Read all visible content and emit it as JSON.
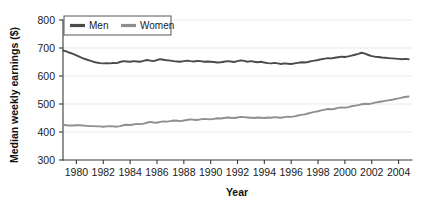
{
  "chart_data": {
    "type": "line",
    "title": "",
    "xlabel": "Year",
    "ylabel": "Median weekly earnings ($)",
    "xlim": [
      1979,
      2005
    ],
    "ylim": [
      300,
      800
    ],
    "yticks": [
      300,
      400,
      500,
      600,
      700,
      800
    ],
    "xticks": [
      1980,
      1982,
      1984,
      1986,
      1988,
      1990,
      1992,
      1994,
      1996,
      1998,
      2000,
      2002,
      2004
    ],
    "grid": true,
    "legend_position": "top-left",
    "colors": {
      "men": "#4a4a4a",
      "women": "#8f8f8f",
      "axis": "#3a3a3a",
      "grid": "#e9e9e9"
    },
    "series": [
      {
        "name": "Men",
        "color": "#4a4a4a",
        "x": [
          1979.0,
          1979.25,
          1979.5,
          1979.75,
          1980.0,
          1980.25,
          1980.5,
          1980.75,
          1981.0,
          1981.25,
          1981.5,
          1981.75,
          1982.0,
          1982.25,
          1982.5,
          1982.75,
          1983.0,
          1983.25,
          1983.5,
          1983.75,
          1984.0,
          1984.25,
          1984.5,
          1984.75,
          1985.0,
          1985.25,
          1985.5,
          1985.75,
          1986.0,
          1986.25,
          1986.5,
          1986.75,
          1987.0,
          1987.25,
          1987.5,
          1987.75,
          1988.0,
          1988.25,
          1988.5,
          1988.75,
          1989.0,
          1989.25,
          1989.5,
          1989.75,
          1990.0,
          1990.25,
          1990.5,
          1990.75,
          1991.0,
          1991.25,
          1991.5,
          1991.75,
          1992.0,
          1992.25,
          1992.5,
          1992.75,
          1993.0,
          1993.25,
          1993.5,
          1993.75,
          1994.0,
          1994.25,
          1994.5,
          1994.75,
          1995.0,
          1995.25,
          1995.5,
          1995.75,
          1996.0,
          1996.25,
          1996.5,
          1996.75,
          1997.0,
          1997.25,
          1997.5,
          1997.75,
          1998.0,
          1998.25,
          1998.5,
          1998.75,
          1999.0,
          1999.25,
          1999.5,
          1999.75,
          2000.0,
          2000.25,
          2000.5,
          2000.75,
          2001.0,
          2001.25,
          2001.5,
          2001.75,
          2002.0,
          2002.25,
          2002.5,
          2002.75,
          2003.0,
          2003.25,
          2003.5,
          2003.75,
          2004.0,
          2004.25,
          2004.5,
          2004.75
        ],
        "values": [
          691,
          688,
          683,
          679,
          674,
          668,
          663,
          659,
          655,
          651,
          648,
          646,
          645,
          646,
          645,
          647,
          646,
          650,
          653,
          652,
          651,
          653,
          652,
          651,
          654,
          657,
          655,
          653,
          657,
          660,
          658,
          656,
          655,
          653,
          652,
          651,
          653,
          655,
          653,
          652,
          654,
          653,
          651,
          652,
          651,
          650,
          648,
          649,
          651,
          653,
          652,
          650,
          653,
          656,
          654,
          651,
          653,
          651,
          649,
          651,
          648,
          646,
          645,
          647,
          645,
          643,
          645,
          644,
          643,
          645,
          647,
          649,
          648,
          650,
          653,
          655,
          657,
          660,
          662,
          664,
          663,
          665,
          667,
          669,
          668,
          670,
          673,
          676,
          679,
          683,
          680,
          675,
          671,
          669,
          668,
          666,
          665,
          664,
          663,
          662,
          661,
          660,
          661,
          660
        ]
      },
      {
        "name": "Women",
        "color": "#8f8f8f",
        "x": [
          1979.0,
          1979.25,
          1979.5,
          1979.75,
          1980.0,
          1980.25,
          1980.5,
          1980.75,
          1981.0,
          1981.25,
          1981.5,
          1981.75,
          1982.0,
          1982.25,
          1982.5,
          1982.75,
          1983.0,
          1983.25,
          1983.5,
          1983.75,
          1984.0,
          1984.25,
          1984.5,
          1984.75,
          1985.0,
          1985.25,
          1985.5,
          1985.75,
          1986.0,
          1986.25,
          1986.5,
          1986.75,
          1987.0,
          1987.25,
          1987.5,
          1987.75,
          1988.0,
          1988.25,
          1988.5,
          1988.75,
          1989.0,
          1989.25,
          1989.5,
          1989.75,
          1990.0,
          1990.25,
          1990.5,
          1990.75,
          1991.0,
          1991.25,
          1991.5,
          1991.75,
          1992.0,
          1992.25,
          1992.5,
          1992.75,
          1993.0,
          1993.25,
          1993.5,
          1993.75,
          1994.0,
          1994.25,
          1994.5,
          1994.75,
          1995.0,
          1995.25,
          1995.5,
          1995.75,
          1996.0,
          1996.25,
          1996.5,
          1996.75,
          1997.0,
          1997.25,
          1997.5,
          1997.75,
          1998.0,
          1998.25,
          1998.5,
          1998.75,
          1999.0,
          1999.25,
          1999.5,
          1999.75,
          2000.0,
          2000.25,
          2000.5,
          2000.75,
          2001.0,
          2001.25,
          2001.5,
          2001.75,
          2002.0,
          2002.25,
          2002.5,
          2002.75,
          2003.0,
          2003.25,
          2003.5,
          2003.75,
          2004.0,
          2004.25,
          2004.5,
          2004.75
        ],
        "values": [
          426,
          424,
          423,
          423,
          424,
          424,
          423,
          422,
          421,
          421,
          420,
          420,
          419,
          420,
          421,
          420,
          419,
          421,
          424,
          426,
          425,
          427,
          429,
          428,
          430,
          433,
          436,
          434,
          433,
          436,
          438,
          437,
          439,
          441,
          440,
          439,
          441,
          443,
          445,
          444,
          443,
          445,
          447,
          446,
          445,
          447,
          449,
          448,
          450,
          452,
          451,
          450,
          452,
          454,
          453,
          452,
          451,
          450,
          452,
          451,
          450,
          452,
          451,
          453,
          452,
          451,
          453,
          455,
          454,
          456,
          459,
          461,
          463,
          466,
          469,
          472,
          474,
          477,
          480,
          482,
          481,
          483,
          486,
          488,
          487,
          489,
          492,
          494,
          496,
          499,
          501,
          500,
          502,
          505,
          507,
          509,
          511,
          513,
          515,
          518,
          520,
          523,
          525,
          527
        ]
      }
    ],
    "legend": [
      {
        "label": "Men",
        "color": "#4a4a4a"
      },
      {
        "label": "Women",
        "color": "#8f8f8f"
      }
    ]
  }
}
